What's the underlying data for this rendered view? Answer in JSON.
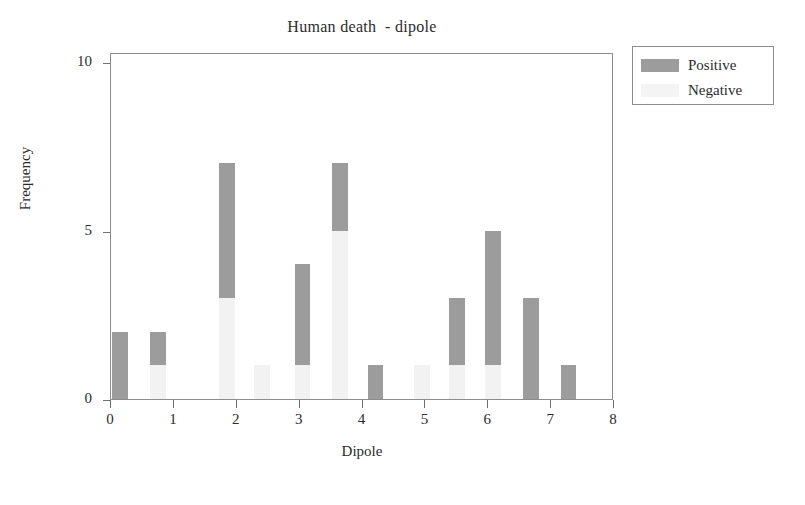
{
  "chart_data": {
    "type": "bar",
    "title": "Human death  - dipole",
    "xlabel": "Dipole",
    "ylabel": "Frequency",
    "xlim": [
      0,
      8
    ],
    "ylim": [
      0,
      10.3
    ],
    "xticks": [
      "0",
      "1",
      "2",
      "3",
      "4",
      "5",
      "6",
      "7",
      "8"
    ],
    "xtick_values": [
      0,
      1,
      2,
      3,
      4,
      5,
      6,
      7,
      8
    ],
    "yticks": [
      "0",
      "5",
      "10"
    ],
    "ytick_values": [
      0,
      5,
      10
    ],
    "grid": false,
    "stacked": true,
    "legend_position": "outside-top-right",
    "series": [
      {
        "name": "Positive",
        "color": "#9c9c9c",
        "values": [
          2,
          1,
          4,
          0,
          3,
          2,
          1,
          0,
          2,
          4,
          3,
          1
        ]
      },
      {
        "name": "Negative",
        "color": "#f2f2f2",
        "values": [
          0,
          1,
          3,
          1,
          1,
          5,
          0,
          1,
          1,
          1,
          0,
          0
        ]
      }
    ],
    "bars": [
      {
        "x": 0.02,
        "positive": 2,
        "negative": 0
      },
      {
        "x": 0.62,
        "positive": 1,
        "negative": 1
      },
      {
        "x": 1.72,
        "positive": 4,
        "negative": 3
      },
      {
        "x": 2.28,
        "positive": 0,
        "negative": 1
      },
      {
        "x": 2.92,
        "positive": 3,
        "negative": 1
      },
      {
        "x": 3.52,
        "positive": 2,
        "negative": 5
      },
      {
        "x": 4.08,
        "positive": 1,
        "negative": 0
      },
      {
        "x": 4.82,
        "positive": 0,
        "negative": 1
      },
      {
        "x": 5.38,
        "positive": 2,
        "negative": 1
      },
      {
        "x": 5.95,
        "positive": 4,
        "negative": 1
      },
      {
        "x": 6.55,
        "positive": 3,
        "negative": 0
      },
      {
        "x": 7.15,
        "positive": 1,
        "negative": 0
      }
    ],
    "bar_totals": [
      2,
      2,
      7,
      1,
      4,
      7,
      1,
      1,
      3,
      5,
      3,
      1
    ],
    "bar_width": 0.25
  },
  "legend": {
    "items": [
      {
        "label": "Positive",
        "swatch": "positive"
      },
      {
        "label": "Negative",
        "swatch": "negative"
      }
    ]
  },
  "colors": {
    "positive": "#9c9c9c",
    "negative": "#f2f2f2",
    "axis": "#8d8d8d",
    "text": "#2b2b2b",
    "background": "#ffffff"
  }
}
